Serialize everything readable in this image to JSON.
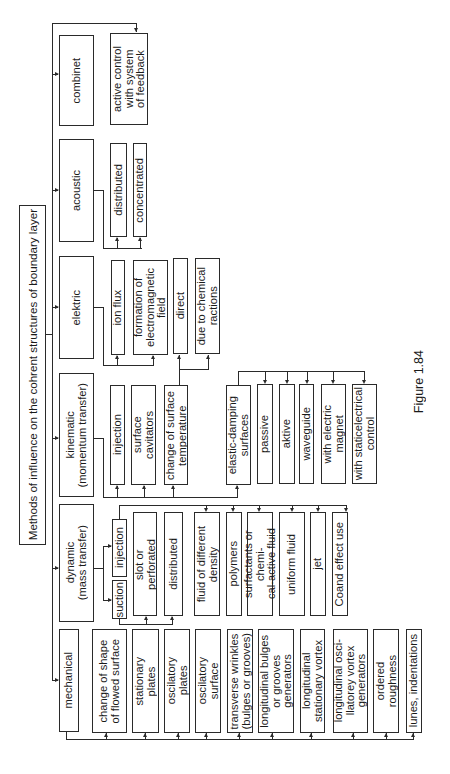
{
  "title": "Methods of influence on the cohrent structures of boundary layer",
  "caption": "Figure 1.84",
  "categories": [
    {
      "label": "combinet"
    },
    {
      "label": "acoustic"
    },
    {
      "label": "elektric"
    },
    {
      "label": "kinematic\n(momentum transfer)"
    },
    {
      "label": "dynamic\n(mass transfer)"
    },
    {
      "label": "mechanical"
    }
  ],
  "combinet_children": [
    "active control\nwith system\nof feedback"
  ],
  "acoustic_children": [
    "distributed",
    "concentrated"
  ],
  "elektric_children": [
    "ion flux",
    "formation of\nelectromagnetic\nfield"
  ],
  "elektric_sub": [
    "direct",
    "due to chemical\nractions"
  ],
  "kinematic_children": [
    "injection",
    "surface\ncavitators",
    "change of surface\ntemperature",
    "elastic-damping\nsurfaces"
  ],
  "elastic_children": [
    "passive",
    "aktive",
    "waveguide",
    "with electric\nmagnet",
    "with staticelectrical\ncontrol"
  ],
  "dynamic_children": [
    "suction",
    "injection"
  ],
  "suction_children": [
    "slot or\nperforated",
    "distributed"
  ],
  "injection_children": [
    "fluid of different\ndensity",
    "polymers",
    "surfactants or chemi-\ncal-active fluid",
    "uniform fluid",
    "jet",
    "Coand effect use"
  ],
  "mechanical_children": [
    "change of shape\nof flowed surface",
    "stationary\nplates",
    "oscilatory\nplates",
    "oscilatory\nsurface",
    "transverse wrinkles\n(bulges or grooves)",
    "longitudinal bulges\nor grooves\ngenerators",
    "longitudinal\nstationary vortex",
    "longitudinal  osci-\nllatorey vortex\ngenerators",
    "ordered\nroughness",
    "lunes, indentations"
  ]
}
